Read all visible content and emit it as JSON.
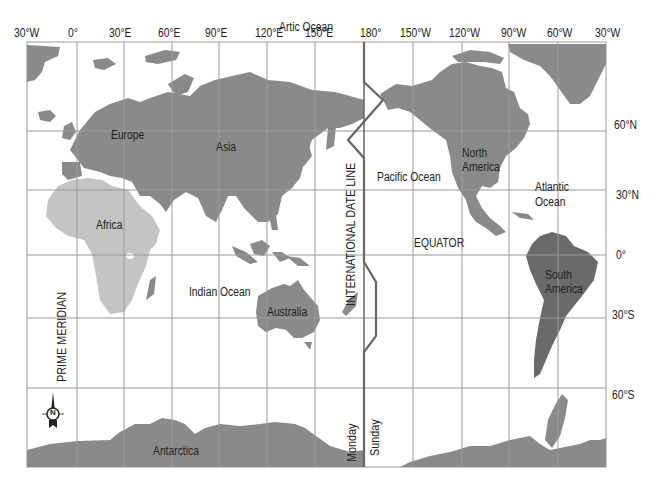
{
  "map": {
    "title": "World map with International Date Line",
    "colors": {
      "land": "#8a8a8a",
      "africa": "#c4c4c4",
      "south_america": "#6a6a6a",
      "grid": "#9a9a9a",
      "date_line": "#666666",
      "background": "#ffffff"
    },
    "longitude_labels": [
      "30°W",
      "0°",
      "30°E",
      "60°E",
      "90°E",
      "120°E",
      "150°E",
      "180°",
      "150°W",
      "120°W",
      "90°W",
      "60°W",
      "30°W"
    ],
    "latitude_labels": [
      "60°N",
      "30°N",
      "0°",
      "30°S",
      "60°S"
    ],
    "continents": {
      "europe": "Europe",
      "asia": "Asia",
      "africa": "Africa",
      "australia": "Australia",
      "north_america": "North\nAmerica",
      "north_america_l1": "North",
      "north_america_l2": "America",
      "south_america_l1": "South",
      "south_america_l2": "America",
      "antarctica": "Antarctica"
    },
    "oceans": {
      "arctic": "Artic Ocean",
      "pacific": "Pacific Ocean",
      "atlantic_l1": "Atlantic",
      "atlantic_l2": "Ocean",
      "indian": "Indian Ocean"
    },
    "lines": {
      "date_line": "INTERNATIONAL DATE LINE",
      "prime_meridian": "PRIME MERIDIAN",
      "equator": "EQUATOR",
      "west_day": "Monday",
      "east_day": "Sunday"
    },
    "compass": {
      "label": "N",
      "icon": "compass-rose-icon"
    }
  }
}
